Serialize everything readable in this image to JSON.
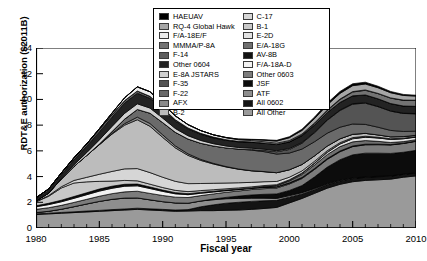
{
  "chart_data": {
    "type": "area",
    "title": "",
    "xlabel": "Fiscal year",
    "ylabel": "RDT&E authorization ($2011B)",
    "xlim": [
      1980,
      2010
    ],
    "ylim": [
      0,
      14
    ],
    "yticks": [
      0,
      2,
      4,
      6,
      8,
      10,
      12,
      14
    ],
    "xticks": [
      1980,
      1985,
      1990,
      1995,
      2000,
      2005,
      2010
    ],
    "xtick_minor_interval": 1,
    "grid": false,
    "stacked": true,
    "legend_position": "top-center",
    "x": [
      1980,
      1981,
      1982,
      1983,
      1984,
      1985,
      1986,
      1987,
      1988,
      1989,
      1990,
      1991,
      1992,
      1993,
      1994,
      1995,
      1996,
      1997,
      1998,
      1999,
      2000,
      2001,
      2002,
      2003,
      2004,
      2005,
      2006,
      2007,
      2008,
      2009,
      2010
    ],
    "series": [
      {
        "name": "All Other",
        "color": "#9a9a9a",
        "values": [
          1.05,
          1.1,
          1.15,
          1.2,
          1.25,
          1.3,
          1.35,
          1.4,
          1.45,
          1.4,
          1.35,
          1.3,
          1.32,
          1.35,
          1.35,
          1.38,
          1.4,
          1.45,
          1.52,
          1.6,
          1.95,
          2.3,
          2.7,
          3.1,
          3.4,
          3.6,
          3.7,
          3.75,
          3.8,
          3.95,
          4.05
        ]
      },
      {
        "name": "All 0602",
        "color": "#141414",
        "values": [
          0.05,
          0.05,
          0.06,
          0.06,
          0.07,
          0.07,
          0.08,
          0.08,
          0.09,
          0.09,
          0.1,
          0.1,
          0.11,
          0.3,
          0.45,
          0.55,
          0.6,
          0.62,
          0.6,
          0.55,
          0.45,
          0.35,
          0.3,
          0.28,
          0.26,
          0.25,
          0.24,
          0.24,
          0.23,
          0.22,
          0.22
        ]
      },
      {
        "name": "ATF",
        "color": "#8e8e8e",
        "values": [
          0.1,
          0.15,
          0.25,
          0.4,
          0.55,
          0.7,
          0.8,
          0.85,
          0.8,
          0.7,
          0.6,
          0.55,
          0.5,
          0.45,
          0.4,
          0.35,
          0.3,
          0.25,
          0.2,
          0.15,
          0.12,
          0.1,
          0.08,
          0.06,
          0.05,
          0.04,
          0.03,
          0.03,
          0.02,
          0.02,
          0.02
        ]
      },
      {
        "name": "JSF",
        "color": "#0c0c0c",
        "values": [
          0,
          0,
          0,
          0,
          0,
          0,
          0,
          0,
          0,
          0,
          0,
          0,
          0,
          0,
          0.05,
          0.1,
          0.18,
          0.25,
          0.3,
          0.35,
          0.4,
          0.55,
          0.9,
          1.3,
          1.6,
          1.8,
          1.85,
          1.8,
          1.75,
          1.7,
          1.75
        ]
      },
      {
        "name": "Other 0603",
        "color": "#7c7c7c",
        "values": [
          0.25,
          0.28,
          0.3,
          0.33,
          0.36,
          0.4,
          0.44,
          0.48,
          0.52,
          0.5,
          0.48,
          0.45,
          0.44,
          0.42,
          0.4,
          0.4,
          0.4,
          0.42,
          0.44,
          0.46,
          0.5,
          0.55,
          0.58,
          0.6,
          0.62,
          0.64,
          0.65,
          0.66,
          0.66,
          0.68,
          0.7
        ]
      },
      {
        "name": "F/A-18A-D",
        "color": "#f2f2f2",
        "values": [
          0.2,
          0.24,
          0.28,
          0.32,
          0.36,
          0.4,
          0.42,
          0.44,
          0.42,
          0.38,
          0.32,
          0.26,
          0.22,
          0.18,
          0.15,
          0.12,
          0.1,
          0.09,
          0.08,
          0.07,
          0.06,
          0.05,
          0.05,
          0.04,
          0.04,
          0.03,
          0.03,
          0.03,
          0.02,
          0.02,
          0.02
        ]
      },
      {
        "name": "AV-8B",
        "color": "#121212",
        "values": [
          0.08,
          0.1,
          0.12,
          0.14,
          0.15,
          0.16,
          0.16,
          0.15,
          0.14,
          0.12,
          0.1,
          0.09,
          0.08,
          0.07,
          0.06,
          0.05,
          0.05,
          0.04,
          0.04,
          0.03,
          0.03,
          0.03,
          0.02,
          0.02,
          0.02,
          0.02,
          0.02,
          0.01,
          0.01,
          0.01,
          0.01
        ]
      },
      {
        "name": "E/A-18G",
        "color": "#6f6f6f",
        "values": [
          0,
          0,
          0,
          0,
          0,
          0,
          0,
          0,
          0,
          0,
          0,
          0,
          0,
          0,
          0,
          0,
          0,
          0,
          0.05,
          0.1,
          0.15,
          0.22,
          0.28,
          0.32,
          0.34,
          0.32,
          0.28,
          0.22,
          0.16,
          0.12,
          0.1
        ]
      },
      {
        "name": "E-2D",
        "color": "#e2e2e2",
        "values": [
          0,
          0,
          0,
          0,
          0,
          0,
          0,
          0,
          0,
          0,
          0,
          0,
          0,
          0,
          0,
          0,
          0,
          0,
          0,
          0,
          0.04,
          0.08,
          0.12,
          0.16,
          0.2,
          0.24,
          0.26,
          0.26,
          0.24,
          0.22,
          0.2
        ]
      },
      {
        "name": "B-1",
        "color": "#c8c8c8",
        "values": [
          0.3,
          0.55,
          0.95,
          1.05,
          0.85,
          0.6,
          0.4,
          0.3,
          0.25,
          0.22,
          0.2,
          0.18,
          0.16,
          0.14,
          0.12,
          0.1,
          0.09,
          0.08,
          0.07,
          0.06,
          0.05,
          0.05,
          0.04,
          0.04,
          0.03,
          0.03,
          0.03,
          0.02,
          0.02,
          0.02,
          0.02
        ]
      },
      {
        "name": "C-17",
        "color": "#d6d6d6",
        "values": [
          0.02,
          0.05,
          0.1,
          0.2,
          0.35,
          0.55,
          0.75,
          0.9,
          0.95,
          0.9,
          0.8,
          0.7,
          0.62,
          0.55,
          0.5,
          0.45,
          0.4,
          0.35,
          0.3,
          0.25,
          0.2,
          0.16,
          0.13,
          0.1,
          0.08,
          0.06,
          0.05,
          0.04,
          0.03,
          0.03,
          0.02
        ]
      },
      {
        "name": "B-2",
        "color": "#bcbcbc",
        "values": [
          0.05,
          0.2,
          0.6,
          1.1,
          1.7,
          2.3,
          2.9,
          3.4,
          3.8,
          3.6,
          3.1,
          2.6,
          2.2,
          1.8,
          1.5,
          1.25,
          1.05,
          0.9,
          0.78,
          0.68,
          0.58,
          0.5,
          0.42,
          0.36,
          0.3,
          0.26,
          0.22,
          0.18,
          0.15,
          0.12,
          0.1
        ]
      },
      {
        "name": "AFX",
        "color": "#8a8a8a",
        "values": [
          0,
          0,
          0,
          0,
          0,
          0,
          0.05,
          0.12,
          0.2,
          0.22,
          0.2,
          0.16,
          0.12,
          0.08,
          0.05,
          0.03,
          0.02,
          0.01,
          0.01,
          0,
          0,
          0,
          0,
          0,
          0,
          0,
          0,
          0,
          0,
          0,
          0
        ]
      },
      {
        "name": "F-22",
        "color": "#6a6a6a",
        "values": [
          0,
          0,
          0,
          0,
          0,
          0.05,
          0.15,
          0.35,
          0.6,
          0.8,
          0.95,
          1.05,
          1.15,
          1.25,
          1.35,
          1.45,
          1.55,
          1.6,
          1.55,
          1.45,
          1.3,
          1.2,
          1.1,
          1.0,
          0.9,
          0.8,
          0.7,
          0.6,
          0.5,
          0.4,
          0.32
        ]
      },
      {
        "name": "F-35",
        "color": "#545454",
        "values": [
          0,
          0,
          0,
          0,
          0,
          0,
          0,
          0,
          0,
          0,
          0,
          0,
          0,
          0,
          0,
          0,
          0,
          0.05,
          0.1,
          0.18,
          0.28,
          0.45,
          0.7,
          1.0,
          1.3,
          1.55,
          1.65,
          1.6,
          1.5,
          1.4,
          1.35
        ]
      },
      {
        "name": "E-8A JSTARS",
        "color": "#d0d0d0",
        "values": [
          0,
          0,
          0.05,
          0.12,
          0.22,
          0.32,
          0.4,
          0.45,
          0.44,
          0.4,
          0.35,
          0.3,
          0.26,
          0.22,
          0.18,
          0.15,
          0.12,
          0.1,
          0.09,
          0.08,
          0.07,
          0.06,
          0.05,
          0.04,
          0.04,
          0.03,
          0.03,
          0.02,
          0.02,
          0.02,
          0.02
        ]
      },
      {
        "name": "Other 0604",
        "color": "#232323",
        "values": [
          0.15,
          0.2,
          0.28,
          0.38,
          0.5,
          0.62,
          0.72,
          0.8,
          0.82,
          0.76,
          0.66,
          0.58,
          0.52,
          0.48,
          0.45,
          0.44,
          0.44,
          0.45,
          0.46,
          0.48,
          0.5,
          0.52,
          0.54,
          0.56,
          0.58,
          0.6,
          0.6,
          0.58,
          0.56,
          0.55,
          0.55
        ]
      },
      {
        "name": "F-14",
        "color": "#5e5e5e",
        "values": [
          0.1,
          0.12,
          0.14,
          0.16,
          0.18,
          0.2,
          0.2,
          0.19,
          0.18,
          0.15,
          0.12,
          0.1,
          0.08,
          0.07,
          0.06,
          0.05,
          0.04,
          0.04,
          0.03,
          0.03,
          0.02,
          0.02,
          0.02,
          0.01,
          0.01,
          0.01,
          0.01,
          0.01,
          0.01,
          0.01,
          0.01
        ]
      },
      {
        "name": "MMMA/P-8A",
        "color": "#737373",
        "values": [
          0,
          0,
          0,
          0,
          0,
          0,
          0,
          0,
          0,
          0,
          0,
          0,
          0,
          0,
          0,
          0,
          0,
          0,
          0,
          0,
          0.03,
          0.06,
          0.1,
          0.15,
          0.22,
          0.3,
          0.36,
          0.4,
          0.42,
          0.44,
          0.46
        ]
      },
      {
        "name": "F/A-18E/F",
        "color": "#ededed",
        "values": [
          0,
          0,
          0,
          0,
          0,
          0.05,
          0.12,
          0.22,
          0.32,
          0.36,
          0.34,
          0.3,
          0.26,
          0.22,
          0.18,
          0.15,
          0.12,
          0.1,
          0.09,
          0.08,
          0.07,
          0.06,
          0.05,
          0.04,
          0.04,
          0.03,
          0.03,
          0.02,
          0.02,
          0.02,
          0.02
        ]
      },
      {
        "name": "RQ-4 Global Hawk",
        "color": "#a6a6a6",
        "values": [
          0,
          0,
          0,
          0,
          0,
          0,
          0,
          0,
          0,
          0,
          0,
          0,
          0,
          0,
          0,
          0.02,
          0.05,
          0.08,
          0.12,
          0.16,
          0.22,
          0.28,
          0.34,
          0.4,
          0.44,
          0.46,
          0.46,
          0.44,
          0.4,
          0.36,
          0.32
        ]
      },
      {
        "name": "HAEUAV",
        "color": "#000000",
        "values": [
          0,
          0,
          0,
          0,
          0,
          0,
          0,
          0,
          0,
          0,
          0,
          0,
          0,
          0,
          0,
          0,
          0,
          0.02,
          0.04,
          0.06,
          0.08,
          0.1,
          0.12,
          0.14,
          0.15,
          0.15,
          0.14,
          0.12,
          0.1,
          0.08,
          0.07
        ]
      }
    ]
  },
  "legend": {
    "left_column": [
      {
        "label": "HAEUAV",
        "color": "#000000"
      },
      {
        "label": "RQ-4 Global Hawk",
        "color": "#a6a6a6"
      },
      {
        "label": "F/A-18E/F",
        "color": "#ededed"
      },
      {
        "label": "MMMA/P-8A",
        "color": "#737373"
      },
      {
        "label": "F-14",
        "color": "#5e5e5e"
      },
      {
        "label": "Other 0604",
        "color": "#232323"
      },
      {
        "label": "E-8A JSTARS",
        "color": "#d0d0d0"
      },
      {
        "label": "F-35",
        "color": "#545454"
      },
      {
        "label": "F-22",
        "color": "#6a6a6a"
      },
      {
        "label": "AFX",
        "color": "#8a8a8a"
      },
      {
        "label": "B-2",
        "color": "#bcbcbc"
      }
    ],
    "right_column": [
      {
        "label": "C-17",
        "color": "#d6d6d6"
      },
      {
        "label": "B-1",
        "color": "#c8c8c8"
      },
      {
        "label": "E-2D",
        "color": "#e2e2e2"
      },
      {
        "label": "E/A-18G",
        "color": "#6f6f6f"
      },
      {
        "label": "AV-8B",
        "color": "#121212"
      },
      {
        "label": "F/A-18A-D",
        "color": "#f2f2f2"
      },
      {
        "label": "Other 0603",
        "color": "#7c7c7c"
      },
      {
        "label": "JSF",
        "color": "#0c0c0c"
      },
      {
        "label": "ATF",
        "color": "#8e8e8e"
      },
      {
        "label": "All 0602",
        "color": "#141414"
      },
      {
        "label": "All Other",
        "color": "#9a9a9a"
      }
    ]
  }
}
